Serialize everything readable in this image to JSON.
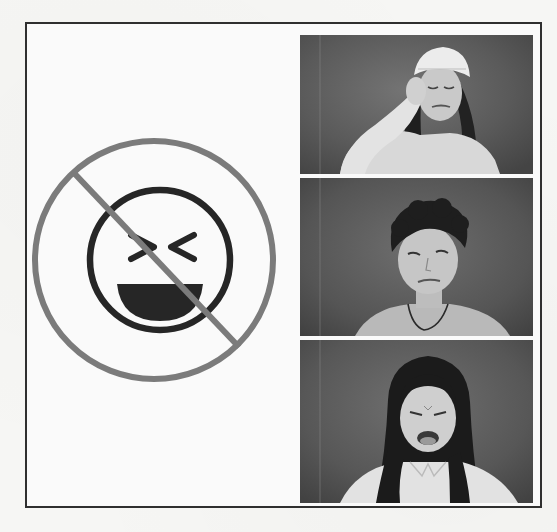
{
  "document": {
    "type": "emotion-illustration-panel",
    "border_color": "#2f2f2f"
  },
  "sign": {
    "icon": "no-laughing-icon",
    "prohibition_color": "#7b7b7b",
    "face_color": "#262626",
    "face": "laughing-face-squinting-eyes"
  },
  "photos": [
    {
      "id": 1,
      "subject": "girl with bandaged head holding hand to head",
      "expression": "pain"
    },
    {
      "id": 2,
      "subject": "boy with curly hair tilting head",
      "expression": "sad"
    },
    {
      "id": 3,
      "subject": "girl with long hair grimacing",
      "expression": "disgust"
    }
  ]
}
